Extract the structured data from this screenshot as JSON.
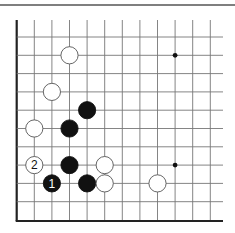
{
  "diagram": {
    "type": "go-board-fragment",
    "top_rule": {
      "y": 5,
      "x1": 0,
      "x2": 235,
      "color": "#555555"
    },
    "grid": {
      "origin_x": 16.7,
      "col_spacing": 17.6,
      "cols": 12,
      "line_right_x": 223,
      "top_y": 20,
      "first_row_y": 37,
      "row_spacing": 18.3,
      "rows": 10,
      "bottom_edge_y": 221,
      "line_color": "#777777",
      "edge_color": "#222222"
    },
    "hoshi": [
      {
        "col": 9,
        "row": 1
      },
      {
        "col": 9,
        "row": 7
      }
    ],
    "stones": [
      {
        "color": "white",
        "col": 3,
        "row": 1,
        "label": ""
      },
      {
        "color": "white",
        "col": 2,
        "row": 3,
        "label": ""
      },
      {
        "color": "black",
        "col": 4,
        "row": 4,
        "label": ""
      },
      {
        "color": "white",
        "col": 1,
        "row": 5,
        "label": ""
      },
      {
        "color": "black",
        "col": 3,
        "row": 5,
        "label": ""
      },
      {
        "color": "white",
        "col": 1,
        "row": 7,
        "label": "2"
      },
      {
        "color": "black",
        "col": 3,
        "row": 7,
        "label": ""
      },
      {
        "color": "white",
        "col": 5,
        "row": 7,
        "label": ""
      },
      {
        "color": "black",
        "col": 2,
        "row": 8,
        "label": "1"
      },
      {
        "color": "black",
        "col": 4,
        "row": 8,
        "label": ""
      },
      {
        "color": "white",
        "col": 5,
        "row": 8,
        "label": ""
      },
      {
        "color": "white",
        "col": 8,
        "row": 8,
        "label": ""
      }
    ],
    "colors": {
      "black_stone": "#111111",
      "white_stone": "#ffffff",
      "stone_outline": "#555555"
    }
  }
}
